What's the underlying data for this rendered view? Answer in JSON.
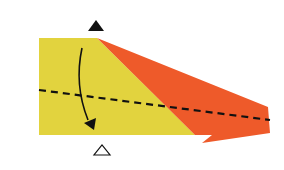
{
  "diagram": {
    "type": "origami-fold-step",
    "colors": {
      "paper_front": "#E2D33E",
      "paper_back": "#EE5A2A",
      "line": "#111111",
      "background": "#ffffff"
    },
    "symbols": {
      "top_marker": "filled-triangle",
      "bottom_marker": "hollow-triangle",
      "fold_line": "valley-fold-dashed",
      "arrow": "fold-arrow-down"
    }
  }
}
